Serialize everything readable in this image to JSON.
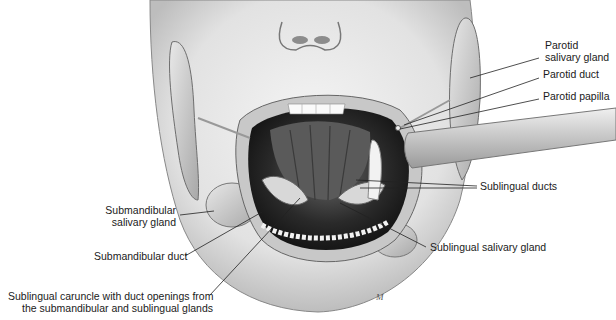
{
  "diagram": {
    "labels": {
      "parotid_gland": {
        "line1": "Parotid",
        "line2": "salivary gland"
      },
      "parotid_duct": "Parotid duct",
      "parotid_papilla": "Parotid papilla",
      "sublingual_ducts": "Sublingual ducts",
      "sublingual_gland": "Sublingual salivary gland",
      "submandibular_gland": {
        "line1": "Submandibular",
        "line2": "salivary gland"
      },
      "submandibular_duct": "Submandibular duct",
      "sublingual_caruncle": {
        "line1": "Sublingual caruncle with duct openings from",
        "line2": "the submandibular and sublingual glands"
      }
    },
    "signature": "M"
  }
}
